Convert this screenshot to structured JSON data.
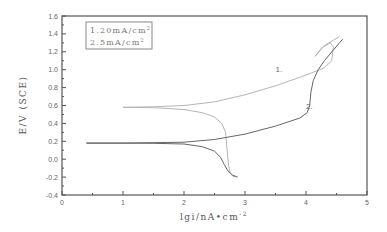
{
  "chart_data": {
    "type": "line",
    "title": "",
    "xlabel": "lgi/nA•cm",
    "xlabel_sup": "-2",
    "ylabel": "E/V (SCE)",
    "xlim": [
      0,
      5
    ],
    "ylim": [
      -0.4,
      1.6
    ],
    "x_ticks": [
      "0",
      "1",
      "2",
      "3",
      "4",
      "5"
    ],
    "y_ticks": [
      "-0.4",
      "-0.2",
      "0.0",
      "0.2",
      "0.4",
      "0.6",
      "0.8",
      "1.0",
      "1.2",
      "1.4",
      "1.6"
    ],
    "grid": false,
    "legend": {
      "position": "top-left",
      "entries": [
        {
          "text": "1.20mA/cm",
          "sup": "2"
        },
        {
          "text": "2.5mA/cm",
          "sup": "2"
        }
      ]
    },
    "series": [
      {
        "name": "1. 20mA/cm2",
        "label": "1.",
        "color": "#b5b5b5",
        "anodic": [
          [
            1.0,
            0.58
          ],
          [
            1.5,
            0.585
          ],
          [
            2.0,
            0.6
          ],
          [
            2.5,
            0.64
          ],
          [
            3.0,
            0.72
          ],
          [
            3.5,
            0.82
          ],
          [
            4.0,
            0.94
          ],
          [
            4.3,
            1.02
          ],
          [
            4.42,
            1.1
          ],
          [
            4.45,
            1.25
          ],
          [
            4.4,
            1.3
          ],
          [
            4.25,
            1.24
          ],
          [
            4.15,
            1.15
          ],
          [
            4.3,
            1.27
          ],
          [
            4.45,
            1.33
          ],
          [
            4.55,
            1.37
          ]
        ],
        "cathodic": [
          [
            1.0,
            0.58
          ],
          [
            1.5,
            0.575
          ],
          [
            2.0,
            0.555
          ],
          [
            2.3,
            0.52
          ],
          [
            2.5,
            0.47
          ],
          [
            2.62,
            0.4
          ],
          [
            2.68,
            0.3
          ],
          [
            2.7,
            0.15
          ],
          [
            2.72,
            0.0
          ],
          [
            2.74,
            -0.1
          ],
          [
            2.76,
            -0.16
          ],
          [
            2.8,
            -0.19
          ],
          [
            2.84,
            -0.2
          ]
        ]
      },
      {
        "name": "2. 5mA/cm2",
        "label": "2.",
        "color": "#666666",
        "anodic": [
          [
            0.4,
            0.18
          ],
          [
            1.0,
            0.18
          ],
          [
            2.0,
            0.19
          ],
          [
            2.5,
            0.22
          ],
          [
            3.0,
            0.28
          ],
          [
            3.5,
            0.37
          ],
          [
            3.9,
            0.46
          ],
          [
            4.02,
            0.52
          ],
          [
            4.06,
            0.6
          ],
          [
            4.08,
            0.75
          ],
          [
            4.12,
            0.88
          ],
          [
            4.2,
            1.0
          ],
          [
            4.3,
            1.1
          ],
          [
            4.45,
            1.22
          ],
          [
            4.55,
            1.3
          ],
          [
            4.6,
            1.34
          ]
        ],
        "cathodic": [
          [
            0.4,
            0.18
          ],
          [
            1.0,
            0.18
          ],
          [
            1.5,
            0.178
          ],
          [
            2.0,
            0.17
          ],
          [
            2.3,
            0.14
          ],
          [
            2.5,
            0.09
          ],
          [
            2.6,
            0.02
          ],
          [
            2.66,
            -0.06
          ],
          [
            2.72,
            -0.13
          ],
          [
            2.8,
            -0.18
          ],
          [
            2.88,
            -0.2
          ]
        ]
      }
    ],
    "annotations": [
      {
        "text": "1.",
        "x": 3.5,
        "y": 0.97
      },
      {
        "text": "2.",
        "x": 4.0,
        "y": 0.56
      }
    ]
  }
}
